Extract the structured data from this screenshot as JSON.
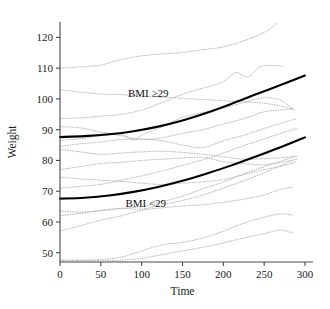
{
  "chart_data": {
    "type": "line",
    "title": "",
    "xlabel": "Time",
    "ylabel": "Weight",
    "xlim": [
      0,
      300
    ],
    "ylim": [
      47,
      125
    ],
    "grid": false,
    "legend_position": "inline-annotations",
    "xticks": [
      0,
      50,
      100,
      150,
      200,
      250,
      300
    ],
    "xtick_labels": [
      "0",
      "50",
      "100",
      "150",
      "200",
      "250",
      "300"
    ],
    "yticks": [
      50,
      60,
      70,
      80,
      90,
      100,
      110,
      120
    ],
    "ytick_labels": [
      "50",
      "60",
      "70",
      "80",
      "90",
      "100",
      "110",
      "120"
    ],
    "annotations": [
      {
        "text": "BMI ≥29",
        "x": 108,
        "y": 100.5
      },
      {
        "text": "BMI <29",
        "x": 105,
        "y": 65.0
      }
    ],
    "series": [
      {
        "name": "BMI ≥29 fitted mean",
        "style": "solid-bold",
        "color": "#000000",
        "x": [
          0,
          30,
          60,
          90,
          120,
          150,
          180,
          210,
          240,
          270,
          300
        ],
        "values": [
          87.6,
          87.9,
          88.5,
          89.5,
          91.0,
          93.0,
          95.5,
          98.4,
          101.5,
          104.5,
          107.6
        ]
      },
      {
        "name": "BMI <29 fitted mean",
        "style": "solid-bold",
        "color": "#000000",
        "x": [
          0,
          30,
          60,
          90,
          120,
          150,
          180,
          210,
          240,
          270,
          300
        ],
        "values": [
          67.6,
          67.9,
          68.6,
          69.8,
          71.4,
          73.4,
          75.8,
          78.4,
          81.3,
          84.3,
          87.5
        ]
      },
      {
        "name": "subject-01",
        "style": "dotted",
        "color": "#a9a9a9",
        "x": [
          0,
          25,
          50,
          75,
          100,
          125,
          150,
          175,
          200,
          225,
          250,
          265
        ],
        "values": [
          110.0,
          110.4,
          111.0,
          112.8,
          114.0,
          114.6,
          115.1,
          116.0,
          116.9,
          118.9,
          121.6,
          124.5
        ]
      },
      {
        "name": "subject-02",
        "style": "dotted",
        "color": "#a9a9a9",
        "x": [
          0,
          25,
          50,
          75,
          100,
          125,
          150,
          175,
          200,
          225,
          250,
          275,
          288
        ],
        "values": [
          103.0,
          102.2,
          101.6,
          101.4,
          100.9,
          100.6,
          100.2,
          99.8,
          99.4,
          99.0,
          98.6,
          97.4,
          96.4
        ]
      },
      {
        "name": "subject-03",
        "style": "dotted",
        "color": "#a9a9a9",
        "x": [
          0,
          25,
          50,
          75,
          100,
          125,
          150,
          175,
          200,
          215,
          230,
          245,
          260,
          272
        ],
        "values": [
          93.6,
          93.8,
          94.4,
          95.0,
          96.4,
          98.8,
          101.5,
          103.5,
          105.6,
          108.6,
          107.2,
          110.4,
          110.9,
          110.6
        ]
      },
      {
        "name": "subject-04",
        "style": "dotted",
        "color": "#a9a9a9",
        "x": [
          0,
          25,
          50,
          75,
          100,
          125,
          150,
          175,
          200,
          225,
          250,
          270,
          285
        ],
        "values": [
          91.0,
          90.6,
          89.2,
          88.0,
          86.8,
          87.4,
          88.8,
          90.0,
          91.8,
          93.6,
          95.8,
          96.4,
          96.8
        ]
      },
      {
        "name": "subject-05",
        "style": "dotted",
        "color": "#a9a9a9",
        "x": [
          0,
          25,
          50,
          75,
          90,
          100,
          125,
          150,
          175,
          200,
          225,
          250,
          270,
          285
        ],
        "values": [
          86.6,
          87.0,
          88.0,
          88.4,
          86.6,
          88.2,
          91.0,
          94.0,
          95.6,
          97.0,
          98.8,
          100.4,
          99.6,
          96.8
        ]
      },
      {
        "name": "subject-06",
        "style": "dotted",
        "color": "#a9a9a9",
        "x": [
          0,
          25,
          50,
          75,
          100,
          125,
          150,
          175,
          200,
          225,
          250,
          275,
          290
        ],
        "values": [
          84.6,
          85.4,
          86.0,
          86.8,
          87.0,
          86.4,
          85.0,
          84.2,
          86.4,
          88.2,
          90.4,
          92.4,
          93.6
        ]
      },
      {
        "name": "subject-07",
        "style": "dotted",
        "color": "#a9a9a9",
        "x": [
          0,
          25,
          50,
          75,
          100,
          125,
          150,
          175,
          200,
          225,
          250,
          275,
          290
        ],
        "values": [
          83.6,
          82.8,
          82.0,
          82.4,
          82.8,
          83.0,
          82.6,
          82.0,
          81.2,
          80.4,
          80.6,
          81.0,
          81.4
        ]
      },
      {
        "name": "subject-08",
        "style": "dotted",
        "color": "#a9a9a9",
        "x": [
          0,
          25,
          50,
          75,
          100,
          125,
          150,
          175,
          200,
          225,
          250,
          275,
          290
        ],
        "values": [
          77.0,
          78.0,
          79.0,
          79.4,
          80.0,
          80.4,
          80.8,
          81.0,
          79.6,
          79.0,
          78.6,
          79.6,
          80.4
        ]
      },
      {
        "name": "subject-09",
        "style": "dotted",
        "color": "#a9a9a9",
        "x": [
          0,
          25,
          50,
          75,
          100,
          125,
          150,
          175,
          200,
          225,
          250,
          275,
          290
        ],
        "values": [
          74.6,
          74.0,
          73.6,
          73.2,
          72.6,
          72.2,
          72.6,
          73.0,
          73.8,
          75.4,
          77.0,
          78.4,
          79.6
        ]
      },
      {
        "name": "subject-10",
        "style": "dotted",
        "color": "#a9a9a9",
        "x": [
          0,
          25,
          50,
          75,
          100,
          125,
          150,
          175,
          200,
          225,
          250,
          275,
          290
        ],
        "values": [
          71.0,
          71.6,
          72.2,
          73.6,
          75.0,
          76.6,
          78.4,
          80.2,
          82.4,
          84.8,
          87.0,
          89.2,
          90.4
        ]
      },
      {
        "name": "subject-11",
        "style": "dotted",
        "color": "#a9a9a9",
        "x": [
          0,
          25,
          50,
          75,
          100,
          125,
          150,
          175,
          200,
          225,
          250,
          275,
          288
        ],
        "values": [
          63.6,
          63.2,
          63.6,
          64.4,
          65.0,
          66.6,
          68.4,
          70.8,
          73.0,
          75.6,
          78.0,
          80.2,
          81.2
        ]
      },
      {
        "name": "subject-12",
        "style": "dotted",
        "color": "#a9a9a9",
        "x": [
          0,
          25,
          50,
          75,
          100,
          125,
          150,
          175,
          200,
          225,
          250,
          275,
          285
        ],
        "values": [
          62.0,
          62.8,
          63.8,
          64.4,
          64.2,
          65.6,
          67.0,
          68.8,
          71.0,
          73.4,
          76.0,
          78.8,
          80.0
        ]
      },
      {
        "name": "subject-13",
        "style": "dotted",
        "color": "#a9a9a9",
        "x": [
          0,
          25,
          50,
          75,
          100,
          125,
          150,
          175,
          200,
          225,
          250,
          270,
          285
        ],
        "values": [
          57.0,
          58.8,
          60.6,
          62.0,
          63.8,
          64.6,
          65.2,
          65.6,
          66.4,
          67.4,
          68.8,
          70.6,
          71.4
        ]
      },
      {
        "name": "subject-14",
        "style": "dotted",
        "color": "#a9a9a9",
        "x": [
          0,
          25,
          50,
          75,
          100,
          125,
          150,
          175,
          200,
          225,
          250,
          270,
          285
        ],
        "values": [
          47.6,
          47.6,
          47.8,
          48.6,
          50.6,
          52.6,
          53.4,
          54.8,
          57.0,
          59.6,
          61.6,
          62.6,
          62.2
        ]
      },
      {
        "name": "subject-15",
        "style": "dotted",
        "color": "#a9a9a9",
        "x": [
          0,
          25,
          50,
          75,
          100,
          125,
          150,
          175,
          200,
          225,
          250,
          270,
          285
        ],
        "values": [
          47.4,
          47.4,
          47.4,
          47.6,
          48.2,
          49.4,
          50.6,
          51.8,
          53.2,
          54.8,
          56.2,
          57.4,
          56.4
        ]
      }
    ]
  },
  "axes": {
    "x_title": "Time",
    "y_title": "Weight"
  }
}
